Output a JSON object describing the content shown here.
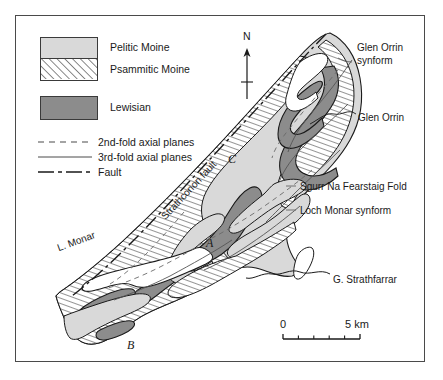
{
  "figure": {
    "domain_hint": "geological-map",
    "frame": {
      "x": 15,
      "y": 15,
      "width": 410,
      "height": 347
    }
  },
  "legend": {
    "items": [
      {
        "id": "pelitic-moine",
        "label": "Pelitic Moine",
        "fill": "#d9d9d9",
        "pattern": "solid-light-grey"
      },
      {
        "id": "psammitic-moine",
        "label": "Psammitic Moine",
        "fill": "#ffffff",
        "pattern": "diagonal-hatch"
      },
      {
        "id": "lewisian",
        "label": "Lewisian",
        "fill": "#8c8c8c",
        "pattern": "solid-dark-grey"
      }
    ],
    "lines": [
      {
        "id": "second-fold-axial-planes",
        "label": "2nd-fold axial planes",
        "style": "dashed"
      },
      {
        "id": "third-fold-axial-planes",
        "label": "3rd-fold axial planes",
        "style": "solid-thin"
      },
      {
        "id": "fault",
        "label": "Fault",
        "style": "dash-dot"
      }
    ]
  },
  "compass": {
    "label": "N"
  },
  "scale_bar": {
    "left_label": "0",
    "right_label": "5 km",
    "divisions": 5,
    "length_km": 5
  },
  "map_labels": [
    {
      "id": "glen-orrin-synform",
      "line1": "Glen Orrin",
      "line2": "synform",
      "x": 357,
      "y": 48
    },
    {
      "id": "glen-orrin",
      "text": "Glen Orrin",
      "x": 358,
      "y": 118
    },
    {
      "id": "sgurr-na-fearstaig-fold",
      "text": "Sgurr Na Fearstaig Fold",
      "x": 300,
      "y": 188
    },
    {
      "id": "loch-monar-synform",
      "text": "Loch Monar synform",
      "x": 300,
      "y": 212
    },
    {
      "id": "g-strathfarrar",
      "text": "G. Strathfarrar",
      "x": 333,
      "y": 281
    },
    {
      "id": "strathconon-fault",
      "text": "Strathconon fault",
      "x": 170,
      "y": 222
    },
    {
      "id": "loch-monar",
      "text": "L. Monar",
      "x": 60,
      "y": 251
    }
  ],
  "section_markers": [
    {
      "id": "section-marker-a",
      "text": "A",
      "x": 206,
      "y": 244
    },
    {
      "id": "section-marker-b",
      "text": "B",
      "x": 127,
      "y": 349
    },
    {
      "id": "section-marker-c",
      "text": "C",
      "x": 228,
      "y": 163
    }
  ],
  "colors": {
    "pelitic": "#d9d9d9",
    "lewisian": "#8c8c8c",
    "outline": "#1a1a1a",
    "frame": "#4a4a4a",
    "hatch": "#3a3a3a",
    "fold_trace": "#555555"
  }
}
